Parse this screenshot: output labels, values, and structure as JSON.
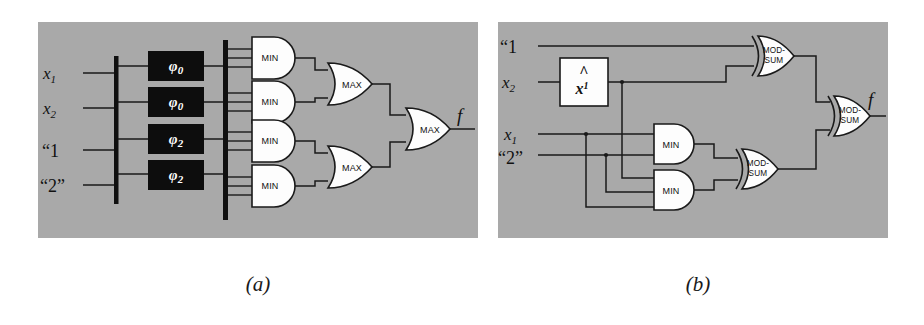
{
  "figure": {
    "background": "#ffffff",
    "panel_fill": "#a9a9a9",
    "wire_color": "#1a1a1a",
    "gate_fill": "#fdfdfd",
    "block_fill": "#0d0d0d"
  },
  "captions": {
    "a": "(a)",
    "b": "(b)"
  },
  "panel_a": {
    "name": "multiple-valued-min-max-circuit",
    "inputs": [
      {
        "id": "in-x1",
        "base": "x",
        "sub": "1",
        "quote": false
      },
      {
        "id": "in-x2",
        "base": "x",
        "sub": "2",
        "quote": false
      },
      {
        "id": "in-const1",
        "base": "“1",
        "sub": "",
        "quote": true
      },
      {
        "id": "in-const2",
        "base": "“2”",
        "sub": "",
        "quote": true
      }
    ],
    "literal_blocks": [
      {
        "id": "phi-block-1",
        "base": "φ",
        "sub": "0"
      },
      {
        "id": "phi-block-2",
        "base": "φ",
        "sub": "0"
      },
      {
        "id": "phi-block-3",
        "base": "φ",
        "sub": "2"
      },
      {
        "id": "phi-block-4",
        "base": "φ",
        "sub": "2"
      }
    ],
    "min_gates": [
      {
        "id": "min-a-1",
        "label": "MIN",
        "inputs": 3
      },
      {
        "id": "min-a-2",
        "label": "MIN",
        "inputs": 3
      },
      {
        "id": "min-a-3",
        "label": "MIN",
        "inputs": 3
      },
      {
        "id": "min-a-4",
        "label": "MIN",
        "inputs": 3
      }
    ],
    "max_gates": [
      {
        "id": "max-a-1",
        "label": "MAX",
        "inputs": 2
      },
      {
        "id": "max-a-2",
        "label": "MAX",
        "inputs": 2
      },
      {
        "id": "max-a-out",
        "label": "MAX",
        "inputs": 2
      }
    ],
    "output": {
      "id": "out-f-a",
      "label": "f"
    },
    "buses": 2
  },
  "panel_b": {
    "name": "mod-sum-circuit",
    "inputs": [
      {
        "id": "in-b-const1",
        "base": "“1",
        "sub": "",
        "quote": true
      },
      {
        "id": "in-b-x2",
        "base": "x",
        "sub": "2",
        "quote": false
      },
      {
        "id": "in-b-x1",
        "base": "x",
        "sub": "1",
        "quote": false
      },
      {
        "id": "in-b-const2",
        "base": "“2”",
        "sub": "",
        "quote": true
      }
    ],
    "literal_box": {
      "id": "xhat-box",
      "hat": "^",
      "base": "x",
      "sup": "1"
    },
    "min_gates": [
      {
        "id": "min-b-1",
        "label": "MIN",
        "inputs": 2
      },
      {
        "id": "min-b-2",
        "label": "MIN",
        "inputs": 2
      }
    ],
    "modsum_gates": [
      {
        "id": "modsum-b-1",
        "line1": "MOD-",
        "line2": "SUM",
        "inputs": 2
      },
      {
        "id": "modsum-b-2",
        "line1": "MOD-",
        "line2": "SUM",
        "inputs": 2
      },
      {
        "id": "modsum-b-out",
        "line1": "MOD-",
        "line2": "SUM",
        "inputs": 2
      }
    ],
    "output": {
      "id": "out-f-b",
      "label": "f"
    }
  }
}
